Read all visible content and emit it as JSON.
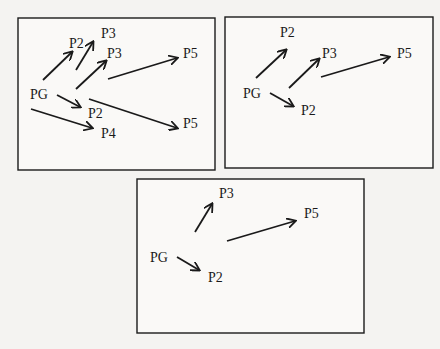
{
  "panels": [
    {
      "labels": [
        {
          "text": "P3",
          "x": 101,
          "y": 38
        },
        {
          "text": "P2",
          "x": 69,
          "y": 48
        },
        {
          "text": "P3",
          "x": 107,
          "y": 58
        },
        {
          "text": "P5",
          "x": 183,
          "y": 58
        },
        {
          "text": "PG",
          "x": 30,
          "y": 99
        },
        {
          "text": "P2",
          "x": 88,
          "y": 118
        },
        {
          "text": "P5",
          "x": 183,
          "y": 128
        },
        {
          "text": "P4",
          "x": 101,
          "y": 138
        }
      ]
    },
    {
      "labels": [
        {
          "text": "P2",
          "x": 280,
          "y": 37
        },
        {
          "text": "P3",
          "x": 322,
          "y": 58
        },
        {
          "text": "P5",
          "x": 397,
          "y": 58
        },
        {
          "text": "PG",
          "x": 243,
          "y": 98
        },
        {
          "text": "P2",
          "x": 301,
          "y": 115
        }
      ]
    },
    {
      "labels": [
        {
          "text": "P3",
          "x": 219,
          "y": 198
        },
        {
          "text": "P5",
          "x": 304,
          "y": 218
        },
        {
          "text": "PG",
          "x": 150,
          "y": 262
        },
        {
          "text": "P2",
          "x": 208,
          "y": 282
        }
      ]
    }
  ]
}
